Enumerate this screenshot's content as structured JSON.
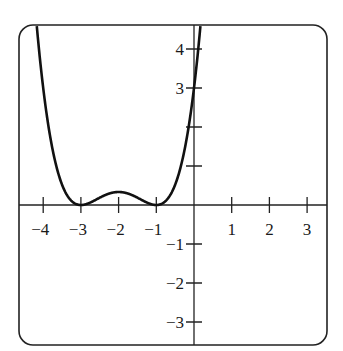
{
  "chart_data": {
    "type": "line",
    "title": "",
    "xlabel": "",
    "ylabel": "",
    "function": "y = (1/3)(x+1)^2 (x+3)^2",
    "xlim": [
      -4.6,
      3.5
    ],
    "ylim": [
      -3.6,
      4.6
    ],
    "grid": false,
    "legend": null,
    "x_ticks": [
      -4,
      -3,
      -2,
      -1,
      1,
      2,
      3
    ],
    "x_tick_labels": [
      "−4",
      "−3",
      "−2",
      "−1",
      "1",
      "2",
      "3"
    ],
    "y_ticks": [
      4,
      3,
      2,
      1,
      -1,
      -2,
      -3
    ],
    "y_tick_labels": [
      "4",
      "3",
      "",
      "",
      "−1",
      "−2",
      "−3"
    ],
    "key_points": [
      {
        "x": -3,
        "y": 0,
        "label": "local minimum (double root)"
      },
      {
        "x": -2,
        "y": 0.333,
        "label": "local maximum"
      },
      {
        "x": -1,
        "y": 0,
        "label": "local minimum (double root)"
      },
      {
        "x": 0,
        "y": 3,
        "label": "y-intercept"
      }
    ],
    "series": [
      {
        "name": "f(x)",
        "x": [
          -4.17,
          -4.0,
          -3.75,
          -3.5,
          -3.25,
          -3.0,
          -2.75,
          -2.5,
          -2.25,
          -2.0,
          -1.75,
          -1.5,
          -1.25,
          -1.0,
          -0.75,
          -0.5,
          -0.25,
          0.0,
          0.1,
          0.17
        ],
        "values": [
          4.6,
          3.0,
          1.3,
          0.52,
          0.117,
          0.0,
          0.047,
          0.188,
          0.297,
          0.333,
          0.297,
          0.188,
          0.047,
          0.0,
          0.117,
          0.52,
          1.3,
          3.0,
          3.79,
          4.6
        ]
      }
    ]
  }
}
